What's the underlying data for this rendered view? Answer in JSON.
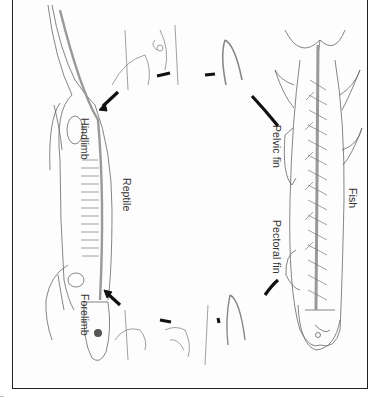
{
  "figure": {
    "orientation": "rotated 90deg clockwise",
    "colors": {
      "line": "#555555",
      "bone": "#777777",
      "arrow": "#111111",
      "frame": "#222222",
      "background": "#fdfdfd"
    }
  },
  "labels": {
    "fish": "Fish",
    "pelvic_fin": "Pelvic fin",
    "pectoral_fin": "Pectoral fin",
    "reptile": "Reptile",
    "hindlimb": "Hindlimb",
    "forelimb": "Forelimb"
  },
  "diagram": {
    "nodes": [
      {
        "id": "fish",
        "label": "Fish"
      },
      {
        "id": "reptile",
        "label": "Reptile"
      },
      {
        "id": "pelvic-fin-series",
        "label": "Pelvic fin → Hindlimb transition sketches",
        "stages": 3
      },
      {
        "id": "pectoral-fin-series",
        "label": "Pectoral fin → Forelimb transition sketches",
        "stages": 3
      }
    ],
    "edges": [
      {
        "from": "Pelvic fin",
        "to": "Hindlimb",
        "via": "intermediate limb sketches"
      },
      {
        "from": "Pectoral fin",
        "to": "Forelimb",
        "via": "intermediate limb sketches"
      }
    ]
  }
}
